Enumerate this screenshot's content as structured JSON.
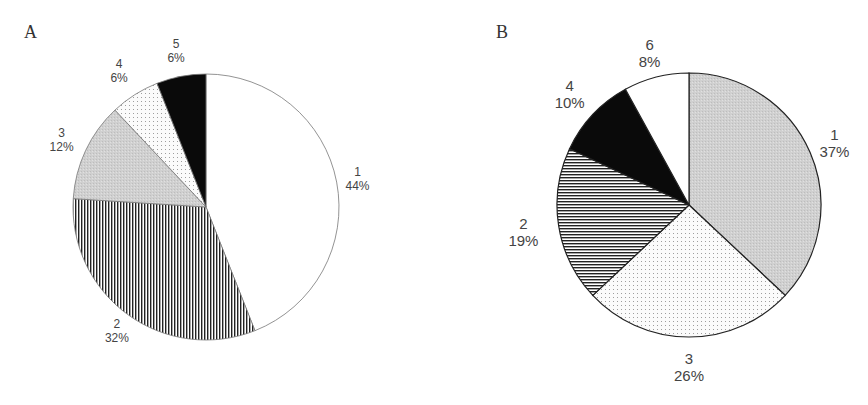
{
  "panels": [
    {
      "letter": "A"
    },
    {
      "letter": "B"
    }
  ],
  "chart_data": [
    {
      "type": "pie",
      "title": "A",
      "start_angle": "12 o'clock, clockwise",
      "categories": [
        "1",
        "2",
        "3",
        "4",
        "5"
      ],
      "values": [
        44,
        32,
        12,
        6,
        6
      ],
      "labels": [
        "44%",
        "32%",
        "12%",
        "6%",
        "6%"
      ],
      "fills": [
        "white",
        "vertical-stripes",
        "light-gray",
        "dotted",
        "black"
      ],
      "center": [
        206,
        207
      ],
      "radius": 133
    },
    {
      "type": "pie",
      "title": "B",
      "start_angle": "12 o'clock, clockwise",
      "categories": [
        "1",
        "3",
        "2",
        "4",
        "6"
      ],
      "values": [
        37,
        26,
        19,
        10,
        8
      ],
      "labels": [
        "37%",
        "26%",
        "19%",
        "10%",
        "8%"
      ],
      "fills": [
        "gray-stipple",
        "dotted",
        "horizontal-stripes",
        "black",
        "white"
      ],
      "center": [
        689,
        205
      ],
      "radius": 132
    }
  ]
}
